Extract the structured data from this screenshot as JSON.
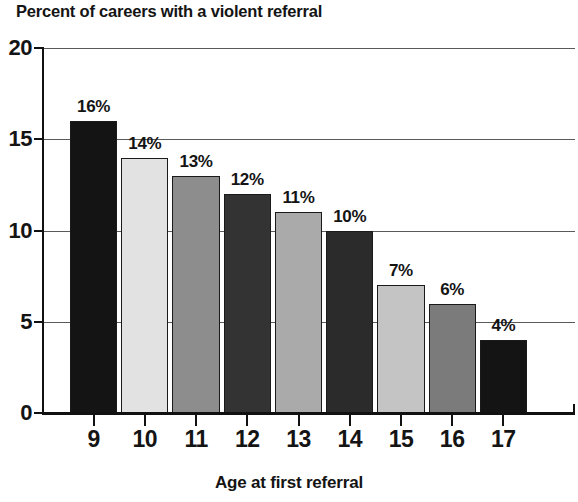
{
  "chart_data": {
    "type": "bar",
    "title": "Percent of careers with a violent referral",
    "xlabel": "Age at first referral",
    "ylabel": "",
    "categories": [
      "9",
      "10",
      "11",
      "12",
      "13",
      "14",
      "15",
      "16",
      "17"
    ],
    "values": [
      16,
      14,
      13,
      12,
      11,
      10,
      7,
      6,
      4
    ],
    "data_labels": [
      "16%",
      "14%",
      "13%",
      "12%",
      "11%",
      "10%",
      "7%",
      "6%",
      "4%"
    ],
    "bar_colors": [
      "#141414",
      "#e2e2e2",
      "#8d8d8d",
      "#333333",
      "#aaaaaa",
      "#2b2b2b",
      "#c4c4c4",
      "#7b7b7b",
      "#141414"
    ],
    "ylim": [
      0,
      20
    ],
    "ytick_labels": [
      "0",
      "5",
      "10",
      "15",
      "20"
    ],
    "ytick_values": [
      0,
      5,
      10,
      15,
      20
    ],
    "grid": true,
    "legend": "none",
    "axis_color": "#111111",
    "gridline_color": "#5a5a5a",
    "text_color": "#141414",
    "background": "#ffffff"
  }
}
